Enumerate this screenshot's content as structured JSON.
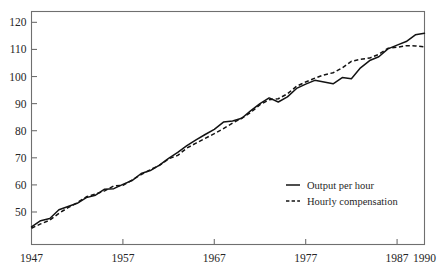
{
  "chart_data": {
    "type": "line",
    "title": "",
    "subtitle": "",
    "xlabel": "",
    "ylabel": "",
    "xlim": [
      1947,
      1990
    ],
    "ylim": [
      38,
      124
    ],
    "grid": false,
    "legend_position": "inside-bottom-right",
    "x_tick_labels": [
      "1947",
      "1957",
      "1967",
      "1977",
      "1987",
      "1990"
    ],
    "x_ticks": [
      1947,
      1957,
      1967,
      1977,
      1987,
      1990
    ],
    "y_tick_labels": [
      "50",
      "60",
      "70",
      "80",
      "90",
      "100",
      "110",
      "120"
    ],
    "y_ticks": [
      50,
      60,
      70,
      80,
      90,
      100,
      110,
      120
    ],
    "x": [
      1947,
      1948,
      1949,
      1950,
      1951,
      1952,
      1953,
      1954,
      1955,
      1956,
      1957,
      1958,
      1959,
      1960,
      1961,
      1962,
      1963,
      1964,
      1965,
      1966,
      1967,
      1968,
      1969,
      1970,
      1971,
      1972,
      1973,
      1974,
      1975,
      1976,
      1977,
      1978,
      1979,
      1980,
      1981,
      1982,
      1983,
      1984,
      1985,
      1986,
      1987,
      1988,
      1989,
      1990
    ],
    "series": [
      {
        "name": "Output per hour",
        "style": "solid",
        "color": "#131313",
        "values": [
          44.5,
          46.8,
          47.6,
          50.8,
          52.0,
          53.2,
          55.3,
          56.2,
          58.4,
          58.6,
          60.2,
          61.6,
          64.2,
          65.3,
          67.3,
          69.8,
          72.0,
          74.5,
          76.6,
          78.6,
          80.5,
          83.2,
          83.6,
          84.6,
          87.4,
          90.0,
          92.1,
          90.6,
          92.5,
          95.6,
          97.2,
          98.6,
          98.0,
          97.3,
          99.6,
          99.2,
          103.2,
          105.9,
          107.3,
          110.2,
          111.6,
          112.9,
          115.4,
          116.0
        ]
      },
      {
        "name": "Hourly compensation",
        "style": "dashed",
        "color": "#131313",
        "values": [
          44.0,
          45.6,
          47.0,
          49.5,
          51.6,
          53.4,
          55.6,
          56.6,
          57.8,
          59.6,
          59.8,
          61.8,
          63.8,
          65.6,
          67.2,
          69.6,
          70.9,
          73.6,
          75.4,
          77.2,
          78.9,
          80.8,
          82.8,
          84.6,
          86.8,
          89.6,
          91.4,
          91.8,
          93.6,
          96.4,
          98.0,
          99.4,
          100.6,
          101.4,
          103.2,
          105.6,
          106.4,
          106.8,
          108.2,
          110.4,
          110.8,
          111.4,
          111.3,
          110.9
        ]
      }
    ],
    "legend": [
      {
        "label": "Output per hour",
        "style": "solid"
      },
      {
        "label": "Hourly compensation",
        "style": "dashed"
      }
    ]
  }
}
